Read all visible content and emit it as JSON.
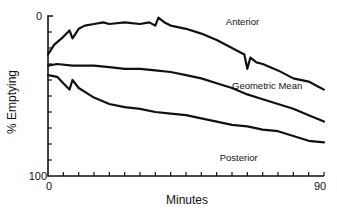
{
  "chart_data": {
    "type": "line",
    "title": "",
    "xlabel": "Minutes",
    "ylabel": "% Emptying",
    "xlim": [
      0,
      90
    ],
    "ylim": [
      0,
      100
    ],
    "y_inverted": true,
    "x_tick_labels": [
      "0",
      "90"
    ],
    "y_tick_labels": [
      "0",
      "100"
    ],
    "x_minor_ticks": 18,
    "y_minor_ticks": 9,
    "grid": false,
    "legend": "inline labels",
    "series": [
      {
        "name": "Anterior",
        "x": [
          0,
          2,
          5,
          7,
          8,
          10,
          12,
          15,
          18,
          20,
          25,
          30,
          33,
          35,
          36,
          38,
          40,
          45,
          50,
          55,
          60,
          64,
          65,
          66,
          68,
          70,
          75,
          80,
          85,
          88,
          90
        ],
        "values": [
          24,
          18,
          13,
          9,
          14,
          8,
          6,
          5,
          4,
          5,
          4,
          5,
          4,
          6,
          1,
          4,
          6,
          8,
          11,
          15,
          20,
          24,
          33,
          26,
          29,
          30,
          34,
          39,
          41,
          44,
          46
        ]
      },
      {
        "name": "Geometric Mean",
        "x": [
          0,
          3,
          8,
          15,
          20,
          25,
          30,
          35,
          40,
          45,
          50,
          55,
          60,
          65,
          70,
          75,
          80,
          85,
          90
        ],
        "values": [
          31,
          30,
          31,
          31,
          32,
          33,
          33,
          34,
          35,
          37,
          39,
          42,
          45,
          49,
          52,
          55,
          58,
          62,
          66
        ]
      },
      {
        "name": "Posterior",
        "x": [
          0,
          3,
          5,
          7,
          8,
          10,
          15,
          20,
          25,
          30,
          35,
          40,
          45,
          50,
          55,
          60,
          65,
          70,
          75,
          80,
          85,
          90
        ],
        "values": [
          37,
          38,
          42,
          46,
          40,
          45,
          51,
          55,
          57,
          58,
          60,
          61,
          62,
          64,
          66,
          68,
          69,
          71,
          72,
          75,
          78,
          79
        ]
      }
    ],
    "annotations": [
      {
        "text": "Anterior",
        "x": 58,
        "y": 3
      },
      {
        "text": "Geometric Mean",
        "x": 60,
        "y": 43
      },
      {
        "text": "Posterior",
        "x": 56,
        "y": 88
      }
    ]
  }
}
